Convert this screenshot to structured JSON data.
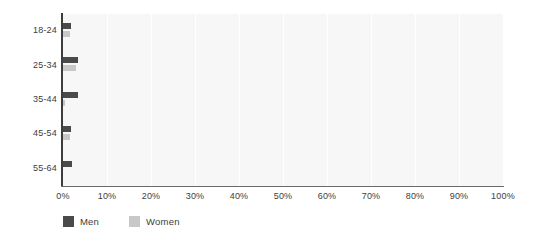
{
  "chart_data": {
    "type": "bar",
    "orientation": "horizontal",
    "title": "",
    "xlabel": "",
    "ylabel": "",
    "categories": [
      "18-24",
      "25-34",
      "35-44",
      "45-54",
      "55-64"
    ],
    "series": [
      {
        "name": "Men",
        "color": "#4a4a4a",
        "values": [
          1.9,
          3.5,
          3.5,
          1.8,
          2.1
        ]
      },
      {
        "name": "Women",
        "color": "#c8c8c8",
        "values": [
          1.5,
          2.9,
          0.5,
          1.6,
          0.0
        ]
      }
    ],
    "xlim": [
      0,
      100
    ],
    "xticks": [
      0,
      10,
      20,
      30,
      40,
      50,
      60,
      70,
      80,
      90,
      100
    ],
    "xtick_labels": [
      "0%",
      "10%",
      "20%",
      "30%",
      "40%",
      "50%",
      "60%",
      "70%",
      "80%",
      "90%",
      "100%"
    ],
    "value_format": "percent",
    "grid": true,
    "grid_axis": "x",
    "legend_position": "bottom-left",
    "plot_background": "#f7f7f7",
    "gridline_color": "#ffffff",
    "axis_color": "#3d3d3d",
    "text_color": "#3d3d3d"
  },
  "legend": {
    "items": [
      {
        "label": "Men",
        "color": "#4a4a4a"
      },
      {
        "label": "Women",
        "color": "#c8c8c8"
      }
    ]
  }
}
